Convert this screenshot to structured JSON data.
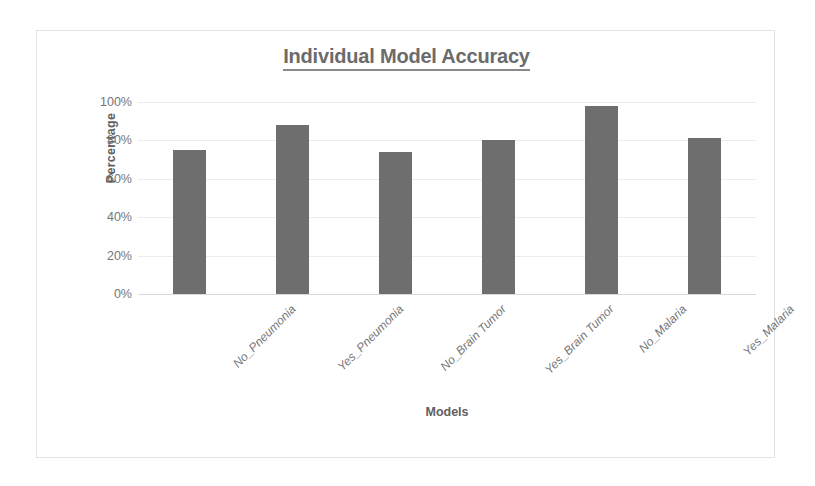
{
  "chart_data": {
    "type": "bar",
    "title": "Individual Model Accuracy",
    "xlabel": "Models",
    "ylabel": "Percentage",
    "categories": [
      "No_Pneumonia",
      "Yes_Pneumonia",
      "No_Brain Tumor",
      "Yes_Brain Tumor",
      "No_Malaria",
      "Yes_Malaria"
    ],
    "values": [
      75,
      88,
      74,
      80,
      98,
      81
    ],
    "ylim": [
      0,
      100
    ],
    "ytick_labels": [
      "100%",
      "80%",
      "60%",
      "40%",
      "20%",
      "0%"
    ],
    "ytick_values": [
      100,
      80,
      60,
      40,
      20,
      0
    ],
    "grid": true,
    "legend": "none",
    "bar_color": "#6e6e6e",
    "gridline_color": "#ececee",
    "title_color": "#6b6b6b",
    "axis_text_color": "#767676",
    "frame_border_color": "#e2e2e4",
    "background_color": "#ffffff"
  }
}
